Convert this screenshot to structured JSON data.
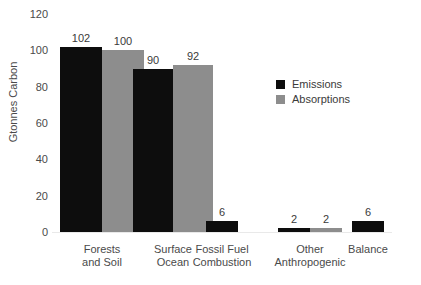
{
  "chart_data": {
    "type": "bar",
    "title": "",
    "xlabel": "",
    "ylabel": "Gtonnes Carbon",
    "ylim": [
      0,
      120
    ],
    "yticks": [
      0,
      20,
      40,
      60,
      80,
      100,
      120
    ],
    "grid": false,
    "legend_position": "inside-right",
    "categories": [
      "Forests and Soil",
      "Surface Ocean",
      "Fossil Fuel Combustion",
      "Other Anthropogenic",
      "Balance"
    ],
    "category_lines": [
      [
        "Forests",
        "and Soil"
      ],
      [
        "Surface",
        "Ocean"
      ],
      [
        "Fossil Fuel",
        "Combustion"
      ],
      [
        "Other",
        "Anthropogenic"
      ],
      [
        "Balance"
      ]
    ],
    "series": [
      {
        "name": "Emissions",
        "color": "#0d0d0d",
        "values": [
          102,
          90,
          6,
          2,
          6
        ]
      },
      {
        "name": "Absorptions",
        "color": "#8d8d8d",
        "values": [
          100,
          92,
          null,
          2,
          null
        ]
      }
    ]
  },
  "legend": {
    "items": [
      {
        "label": "Emissions",
        "swatch": "emissions"
      },
      {
        "label": "Absorptions",
        "swatch": "absorptions"
      }
    ]
  },
  "axis": {
    "y_label": "Gtonnes Carbon",
    "y_tick_labels": [
      "120",
      "100",
      "80",
      "60",
      "40",
      "20",
      "0"
    ]
  }
}
